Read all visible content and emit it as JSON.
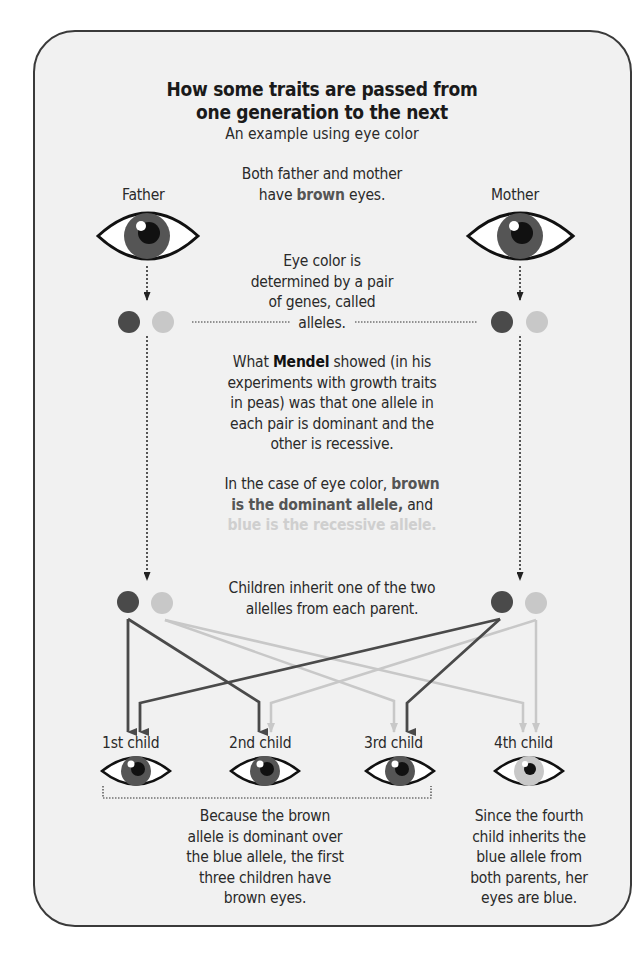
{
  "header": {
    "title_line1": "How some traits are passed from",
    "title_line2": "one generation to the next",
    "subtitle": "An example using eye color"
  },
  "intro": {
    "line1": "Both father and mother",
    "line2_pre": "have ",
    "line2_bold": "brown",
    "line2_post": " eyes."
  },
  "parents": {
    "father_label": "Father",
    "mother_label": "Mother"
  },
  "alleles_note": {
    "line1": "Eye color is",
    "line2": "determined by a pair",
    "line3": "of genes, called",
    "line4": "alleles."
  },
  "mendel_note": {
    "line1_pre": "What ",
    "line1_bold": "Mendel",
    "line1_post": " showed (in his",
    "line2": "experiments with growth traits",
    "line3": "in peas) was that one allele in",
    "line4": "each pair is dominant and the",
    "line5": "other is recessive."
  },
  "dominance_note": {
    "line1_pre": "In the case of eye color, ",
    "line1_bold": "brown",
    "line2_bold": "is the dominant allele,",
    "line2_post": " and",
    "line3_light": "blue is  the recessive allele."
  },
  "inherit_note": {
    "line1": "Children inherit one of the two",
    "line2": "allelles from each parent."
  },
  "children": [
    {
      "label": "1st child",
      "eye": "brown"
    },
    {
      "label": "2nd child",
      "eye": "brown"
    },
    {
      "label": "3rd child",
      "eye": "brown"
    },
    {
      "label": "4th child",
      "eye": "blue"
    }
  ],
  "conclusion_brown": {
    "line1": "Because the brown",
    "line2": "allele is dominant over",
    "line3": "the blue allele, the first",
    "line4": "three children have",
    "line5": "brown eyes."
  },
  "conclusion_blue": {
    "line1": "Since the fourth",
    "line2": "child inherits the",
    "line3": "blue allele from",
    "line4": "both parents, her",
    "line5": "eyes are blue."
  },
  "colors": {
    "brown_allele": "#4a4a4a",
    "blue_allele": "#c8c8c8",
    "background": "#f1f1f1",
    "border": "#3a3a3a"
  }
}
